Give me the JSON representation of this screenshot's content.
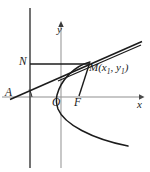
{
  "figure": {
    "kind": "parabola-geometry-diagram",
    "background_color": "#ffffff",
    "stroke_color": "#1a1a1a",
    "axis_color": "#8a8a8a",
    "directrix_color": "#555555",
    "axes": {
      "x_label": "x",
      "y_label": "y",
      "origin_label": "O",
      "x_axis_y": 97,
      "y_axis_x": 61,
      "x_arrow_tip_x": 143,
      "y_arrow_tip_y": 21
    },
    "points": [
      {
        "name": "A",
        "label": "A",
        "x": 14,
        "y": 97,
        "label_x": 5,
        "label_y": 88
      },
      {
        "name": "N",
        "label": "N",
        "x": 30,
        "y": 64,
        "label_x": 19,
        "label_y": 56
      },
      {
        "name": "O",
        "label": "O",
        "x": 61,
        "y": 97,
        "label_x": 53,
        "label_y": 97
      },
      {
        "name": "F",
        "label": "F",
        "x": 79,
        "y": 97,
        "label_x": 74,
        "label_y": 97
      },
      {
        "name": "M",
        "label": "M",
        "x": 89,
        "y": 64,
        "label_x": 90,
        "label_y": 62
      }
    ],
    "point_m_label": {
      "name": "M",
      "open_paren": "(",
      "x_var": "x",
      "x_sub": "1",
      "comma": ", ",
      "y_var": "y",
      "y_sub": "1",
      "close_paren": ")"
    },
    "curve": {
      "name": "parabola",
      "description": "rightward-opening parabola with vertex near origin",
      "vertex": {
        "x": 56,
        "y": 97
      },
      "upper_end": {
        "x": 90,
        "y": 62
      },
      "lower_end": {
        "x": 128,
        "y": 146
      }
    },
    "lines": [
      {
        "name": "directrix",
        "desc": "vertical line through N",
        "x1": 30,
        "y1": 8,
        "x2": 30,
        "y2": 168
      },
      {
        "name": "segment-NM",
        "desc": "horizontal from N to M",
        "x1": 30,
        "y1": 64,
        "x2": 90,
        "y2": 64
      },
      {
        "name": "line-AM-extended",
        "desc": "secant from A through M extended up-right",
        "x1": 11,
        "y1": 99,
        "x2": 141,
        "y2": 42
      },
      {
        "name": "tangent-at-M",
        "desc": "second near-parallel ray to upper right",
        "x1": 60,
        "y1": 80,
        "x2": 140,
        "y2": 45
      },
      {
        "name": "segment-FM",
        "desc": "focal radius from F to M",
        "x1": 79,
        "y1": 96,
        "x2": 89,
        "y2": 64
      },
      {
        "name": "angle-arc-at-A",
        "desc": "angle mark at point A"
      }
    ]
  }
}
